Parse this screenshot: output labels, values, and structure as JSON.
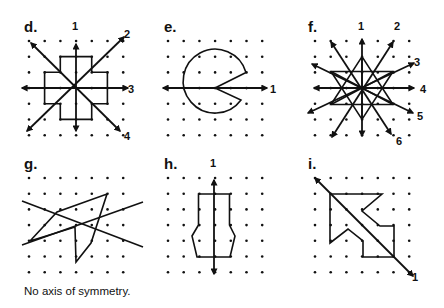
{
  "figure": {
    "grid": {
      "rows": 7,
      "cols": 7,
      "spacing": 15.7
    },
    "panels": [
      {
        "id": "d",
        "label": "d.",
        "origin": [
          29,
          41
        ],
        "axes": [
          "1",
          "2",
          "3",
          "4"
        ],
        "shape": "plus-shaped cross with 4 axes"
      },
      {
        "id": "e",
        "label": "e.",
        "origin": [
          168,
          41
        ],
        "axes": [
          "1"
        ],
        "shape": "circle with wedge cut (pac-man)"
      },
      {
        "id": "f",
        "label": "f.",
        "origin": [
          315,
          41
        ],
        "axes": [
          "1",
          "2",
          "3",
          "4",
          "5",
          "6"
        ],
        "shape": "six-pointed star with 6 axes"
      },
      {
        "id": "g",
        "label": "g.",
        "origin": [
          29,
          178
        ],
        "axes": [],
        "shape": "irregular polygon with two crossing trial lines",
        "caption": "No axis of symmetry."
      },
      {
        "id": "h",
        "label": "h.",
        "origin": [
          168,
          178
        ],
        "axes": [
          "1"
        ],
        "shape": "bottle-shaped hexagonal polygon"
      },
      {
        "id": "i",
        "label": "i.",
        "origin": [
          315,
          178
        ],
        "axes": [
          "1"
        ],
        "shape": "arrow shape pointing up-left with diagonal axis"
      }
    ]
  },
  "labels": {
    "d": "d.",
    "e": "e.",
    "f": "f.",
    "g": "g.",
    "h": "h.",
    "i": "i.",
    "d_axes": [
      "1",
      "2",
      "3",
      "4"
    ],
    "e_axes": [
      "1"
    ],
    "f_axes": [
      "1",
      "2",
      "3",
      "4",
      "5",
      "6"
    ],
    "h_axes": [
      "1"
    ],
    "i_axes": [
      "1"
    ]
  },
  "caption_g": "No axis of symmetry."
}
